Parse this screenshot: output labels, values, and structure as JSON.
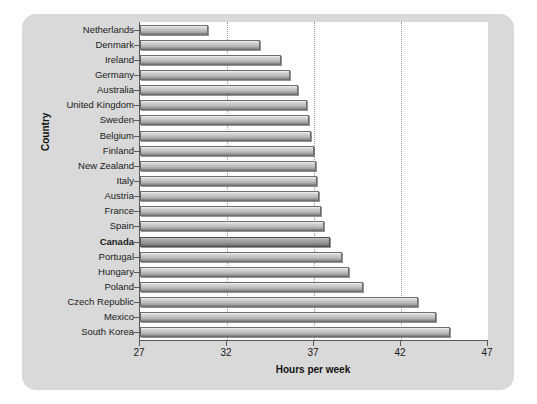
{
  "chart_data": {
    "type": "bar",
    "orientation": "horizontal",
    "title": "",
    "xlabel": "Hours per week",
    "ylabel": "Country",
    "xlim": [
      27,
      47
    ],
    "xticks": [
      27,
      32,
      37,
      42,
      47
    ],
    "gridlines": [
      32,
      37,
      42
    ],
    "grid": true,
    "legend": "none",
    "categories": [
      "Netherlands",
      "Denmark",
      "Ireland",
      "Germany",
      "Australia",
      "United Kingdom",
      "Sweden",
      "Belgium",
      "Finland",
      "New Zealand",
      "Italy",
      "Austria",
      "France",
      "Spain",
      "Canada",
      "Portugal",
      "Hungary",
      "Poland",
      "Czech Republic",
      "Mexico",
      "South Korea"
    ],
    "values": [
      30.9,
      33.9,
      35.1,
      35.6,
      36.1,
      36.6,
      36.7,
      36.8,
      37.0,
      37.1,
      37.2,
      37.3,
      37.4,
      37.6,
      37.9,
      38.6,
      39.0,
      39.8,
      43.0,
      44.0,
      44.8
    ],
    "highlight": "Canada"
  },
  "colors": {
    "panel": "#d9d9d9",
    "plot_background": "#ffffff",
    "axis": "#5a5a5a",
    "gridline": "#9a9a9a",
    "bar_light": "#f2f2f2",
    "bar_dark": "#7b7b7b",
    "bar_highlight_dark": "#606060",
    "text": "#1a1a1a"
  }
}
